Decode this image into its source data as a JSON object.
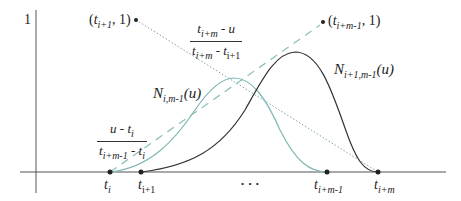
{
  "diagram": {
    "axis": {
      "y_tick_label": "1"
    },
    "points": {
      "left": {
        "t": "t",
        "sub": "i+1",
        "rest": ", 1)",
        "open": "("
      },
      "right": {
        "t": "t",
        "sub": "i+m-1",
        "rest": ", 1)",
        "open": "("
      }
    },
    "fractions": {
      "falling": {
        "num_t": "t",
        "num_sub": "i+m",
        "num_rest": " - u",
        "den_t": "t",
        "den_sub": "i+m",
        "den_mid": " - t",
        "den_sub2": "i+1"
      },
      "rising": {
        "num_lead": "u - t",
        "num_sub": "i",
        "den_t": "t",
        "den_sub": "i+m-1",
        "den_mid": " - t",
        "den_sub2": "i"
      }
    },
    "curves": {
      "teal": {
        "name": "N",
        "sub": "i,m-1",
        "arg": "(u)",
        "color": "#7fb8b4"
      },
      "black": {
        "name": "N",
        "sub": "i+1,m-1",
        "arg": "(u)",
        "color": "#333333"
      }
    },
    "knots": [
      {
        "t": "t",
        "sub": "i"
      },
      {
        "t": "t",
        "sub": "i+1"
      },
      {
        "t": "t",
        "sub": "i+m-1"
      },
      {
        "t": "t",
        "sub": "i+m"
      }
    ],
    "ellipsis": "• • •",
    "colors": {
      "dashed_line": "#8fc2bc",
      "dotted_line": "#7f9fb0",
      "axis": "#444444"
    }
  }
}
